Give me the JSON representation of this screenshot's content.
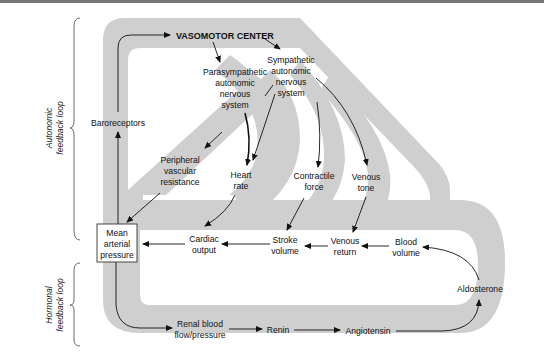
{
  "side_labels": {
    "autonomic": [
      "Autonomic",
      "feedback loop"
    ],
    "hormonal": [
      "Hormonal",
      "feedback loop"
    ]
  },
  "nodes": {
    "vasomotor_center": "VASOMOTOR CENTER",
    "parasympathetic": [
      "Parasympathetic",
      "autonomic",
      "nervous",
      "system"
    ],
    "sympathetic": [
      "Sympathetic",
      "autonomic",
      "nervous",
      "system"
    ],
    "baroreceptors": "Baroreceptors",
    "peripheral_vascular_resistance": [
      "Peripheral",
      "vascular",
      "resistance"
    ],
    "heart_rate": [
      "Heart",
      "rate"
    ],
    "contractile_force": [
      "Contractile",
      "force"
    ],
    "venous_tone": [
      "Venous",
      "tone"
    ],
    "mean_arterial_pressure": [
      "Mean",
      "arterial",
      "pressure"
    ],
    "cardiac_output": [
      "Cardiac",
      "output"
    ],
    "stroke_volume": [
      "Stroke",
      "volume"
    ],
    "venous_return": [
      "Venous",
      "return"
    ],
    "blood_volume": [
      "Blood",
      "volume"
    ],
    "aldosterone": "Aldosterone",
    "renal_blood_flow": [
      "Renal blood",
      "flow/pressure"
    ],
    "renin": "Renin",
    "angiotensin": "Angiotensin"
  },
  "colors": {
    "band": "#cfcfcf",
    "text": "#111111",
    "box_border": "#333333"
  }
}
